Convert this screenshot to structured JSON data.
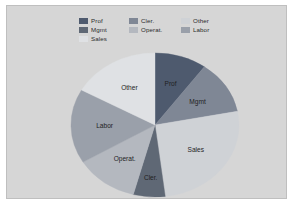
{
  "panel": {
    "background_color": "#d6d6d6",
    "border_color": "#bfbfbf"
  },
  "legend": {
    "items": [
      {
        "label": "Prof",
        "color": "#4e5a6e"
      },
      {
        "label": "Mgmt",
        "color": "#7f8795"
      },
      {
        "label": "Sales",
        "color": "#cfd2d6"
      },
      {
        "label": "Cler.",
        "color": "#5f6875"
      },
      {
        "label": "Operat.",
        "color": "#b4b8bf"
      },
      {
        "label": "Labor",
        "color": "#9aa0aa"
      },
      {
        "label": "Other",
        "color": "#dfe1e4"
      }
    ]
  },
  "chart_data": {
    "type": "pie",
    "title": "",
    "xlabel": "",
    "ylabel": "",
    "legend_position": "top",
    "grid": false,
    "start_angle_deg": 90,
    "direction": "clockwise",
    "categories": [
      "Prof",
      "Mgmt",
      "Sales",
      "Cler.",
      "Operat.",
      "Labor",
      "Other"
    ],
    "values": [
      10,
      12,
      26,
      6,
      12,
      17,
      17
    ],
    "units": "percent",
    "slices": [
      {
        "label": "Prof",
        "value": 10,
        "angle_deg": 36,
        "color": "#4e5a6e",
        "label_shown": "Prof"
      },
      {
        "label": "Mgmt",
        "value": 12,
        "angle_deg": 43,
        "color": "#7f8795",
        "label_shown": "Mgmt"
      },
      {
        "label": "Sales",
        "value": 26,
        "angle_deg": 94,
        "color": "#cfd2d6",
        "label_shown": "Sales"
      },
      {
        "label": "Cler.",
        "value": 6,
        "angle_deg": 22,
        "color": "#5f6875",
        "label_shown": "Cler."
      },
      {
        "label": "Operat.",
        "value": 12,
        "angle_deg": 44,
        "color": "#b4b8bf",
        "label_shown": "Operat."
      },
      {
        "label": "Labor",
        "value": 17,
        "angle_deg": 60,
        "color": "#9aa0aa",
        "label_shown": "Labor"
      },
      {
        "label": "Other",
        "value": 17,
        "angle_deg": 61,
        "color": "#dfe1e4",
        "label_shown": "Other"
      }
    ]
  }
}
